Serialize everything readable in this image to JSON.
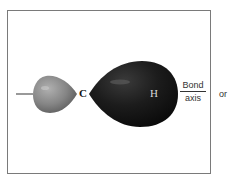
{
  "diagram": {
    "title": "",
    "atoms": {
      "left": "C",
      "right": "H"
    },
    "axis_label": {
      "top": "Bond",
      "bottom": "axis"
    },
    "trailing_text": "or",
    "colors": {
      "small_lobe": "#8a8a8a",
      "large_lobe": "#1a1a1a",
      "frame": "#7a7a7a",
      "bond_line": "#555555"
    }
  }
}
